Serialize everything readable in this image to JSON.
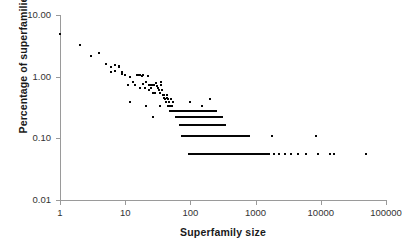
{
  "figure": {
    "background_color": "#ffffff",
    "axis_color": "#9a9a9a",
    "marker_color": "#050505",
    "label_color": "#333333",
    "title_color": "#1a1a1a"
  },
  "chart_data": {
    "type": "scatter",
    "title": "",
    "xlabel": "Superfamily size",
    "ylabel": "Percentage of superfamilies",
    "xscale": "log",
    "yscale": "log",
    "xlim": [
      1,
      100000
    ],
    "ylim": [
      0.01,
      10.0
    ],
    "grid": false,
    "legend": null,
    "xtick_labels": [
      "1",
      "10",
      "100",
      "1000",
      "10000",
      "100000"
    ],
    "xtick_values": [
      1,
      10,
      100,
      1000,
      10000,
      100000
    ],
    "ytick_labels": [
      "10.00",
      "1.00",
      "0.10",
      "0.01"
    ],
    "ytick_values": [
      10.0,
      1.0,
      0.1,
      0.01
    ],
    "marker": "small filled square",
    "marker_size_px": 2,
    "points": [
      [
        1,
        5.0
      ],
      [
        2,
        3.3
      ],
      [
        3,
        2.2
      ],
      [
        4,
        2.4
      ],
      [
        5,
        1.6
      ],
      [
        6,
        1.45
      ],
      [
        6,
        1.2
      ],
      [
        7,
        1.55
      ],
      [
        7,
        1.25
      ],
      [
        8,
        1.5
      ],
      [
        8,
        1.45
      ],
      [
        9,
        1.2
      ],
      [
        9,
        1.1
      ],
      [
        10,
        1.05
      ],
      [
        11,
        0.72
      ],
      [
        12,
        0.97
      ],
      [
        12,
        0.39
      ],
      [
        13,
        0.82
      ],
      [
        14,
        0.72
      ],
      [
        15,
        1.05
      ],
      [
        16,
        1.05
      ],
      [
        17,
        1.05
      ],
      [
        17,
        0.66
      ],
      [
        18,
        1.02
      ],
      [
        19,
        1.05
      ],
      [
        19,
        0.77
      ],
      [
        20,
        0.66
      ],
      [
        21,
        0.83
      ],
      [
        21,
        0.33
      ],
      [
        22,
        1.02
      ],
      [
        23,
        0.72
      ],
      [
        23,
        0.6
      ],
      [
        24,
        0.72
      ],
      [
        25,
        0.66
      ],
      [
        26,
        0.72
      ],
      [
        27,
        0.55
      ],
      [
        27,
        0.22
      ],
      [
        28,
        0.72
      ],
      [
        29,
        0.55
      ],
      [
        30,
        0.78
      ],
      [
        31,
        0.7
      ],
      [
        32,
        0.66
      ],
      [
        33,
        0.6
      ],
      [
        34,
        0.55
      ],
      [
        34,
        0.33
      ],
      [
        35,
        0.83
      ],
      [
        36,
        0.72
      ],
      [
        37,
        0.6
      ],
      [
        38,
        0.5
      ],
      [
        39,
        0.45
      ],
      [
        40,
        0.5
      ],
      [
        41,
        0.44
      ],
      [
        42,
        0.39
      ],
      [
        43,
        0.45
      ],
      [
        44,
        0.5
      ],
      [
        45,
        0.33
      ],
      [
        46,
        0.44
      ],
      [
        47,
        0.39
      ],
      [
        48,
        0.33
      ],
      [
        49,
        0.28
      ],
      [
        50,
        0.44
      ],
      [
        52,
        0.33
      ],
      [
        54,
        0.39
      ],
      [
        55,
        0.28
      ],
      [
        56,
        0.28
      ],
      [
        58,
        0.28
      ],
      [
        60,
        0.28
      ],
      [
        62,
        0.28
      ],
      [
        64,
        0.28
      ],
      [
        66,
        0.28
      ],
      [
        68,
        0.28
      ],
      [
        70,
        0.22
      ],
      [
        72,
        0.22
      ],
      [
        74,
        0.28
      ],
      [
        76,
        0.22
      ],
      [
        78,
        0.165
      ],
      [
        80,
        0.22
      ],
      [
        82,
        0.28
      ],
      [
        85,
        0.165
      ],
      [
        88,
        0.22
      ],
      [
        90,
        0.11
      ],
      [
        92,
        0.165
      ],
      [
        95,
        0.22
      ],
      [
        98,
        0.165
      ],
      [
        100,
        0.39
      ],
      [
        100,
        0.28
      ],
      [
        102,
        0.22
      ],
      [
        105,
        0.11
      ],
      [
        108,
        0.165
      ],
      [
        110,
        0.22
      ],
      [
        112,
        0.055
      ],
      [
        115,
        0.165
      ],
      [
        118,
        0.11
      ],
      [
        120,
        0.28
      ],
      [
        124,
        0.22
      ],
      [
        128,
        0.165
      ],
      [
        132,
        0.11
      ],
      [
        136,
        0.055
      ],
      [
        140,
        0.22
      ],
      [
        145,
        0.165
      ],
      [
        150,
        0.33
      ],
      [
        150,
        0.11
      ],
      [
        155,
        0.055
      ],
      [
        160,
        0.22
      ],
      [
        165,
        0.165
      ],
      [
        170,
        0.11
      ],
      [
        175,
        0.055
      ],
      [
        180,
        0.28
      ],
      [
        185,
        0.165
      ],
      [
        190,
        0.11
      ],
      [
        195,
        0.055
      ],
      [
        200,
        0.44
      ],
      [
        200,
        0.22
      ],
      [
        210,
        0.165
      ],
      [
        215,
        0.11
      ],
      [
        220,
        0.055
      ],
      [
        230,
        0.22
      ],
      [
        240,
        0.165
      ],
      [
        250,
        0.28
      ],
      [
        250,
        0.11
      ],
      [
        260,
        0.055
      ],
      [
        275,
        0.165
      ],
      [
        290,
        0.11
      ],
      [
        300,
        0.055
      ],
      [
        320,
        0.11
      ],
      [
        340,
        0.165
      ],
      [
        350,
        0.055
      ],
      [
        380,
        0.11
      ],
      [
        400,
        0.055
      ],
      [
        430,
        0.11
      ],
      [
        450,
        0.055
      ],
      [
        480,
        0.11
      ],
      [
        500,
        0.055
      ],
      [
        550,
        0.11
      ],
      [
        600,
        0.055
      ],
      [
        650,
        0.11
      ],
      [
        700,
        0.055
      ],
      [
        750,
        0.11
      ],
      [
        800,
        0.055
      ],
      [
        900,
        0.055
      ],
      [
        1000,
        0.055
      ],
      [
        1100,
        0.055
      ],
      [
        1300,
        0.055
      ],
      [
        1500,
        0.055
      ],
      [
        1800,
        0.11
      ],
      [
        1900,
        0.055
      ],
      [
        2300,
        0.055
      ],
      [
        2800,
        0.055
      ],
      [
        3500,
        0.055
      ],
      [
        4500,
        0.055
      ],
      [
        6000,
        0.055
      ],
      [
        8500,
        0.11
      ],
      [
        9000,
        0.055
      ],
      [
        14000,
        0.055
      ],
      [
        16000,
        0.055
      ],
      [
        50000,
        0.055
      ]
    ],
    "dense_bands": [
      {
        "value": 0.275,
        "x_from": 50,
        "x_to": 250,
        "count": 34
      },
      {
        "value": 0.22,
        "x_from": 60,
        "x_to": 300,
        "count": 46
      },
      {
        "value": 0.165,
        "x_from": 70,
        "x_to": 340,
        "count": 56
      },
      {
        "value": 0.11,
        "x_from": 75,
        "x_to": 800,
        "count": 86
      },
      {
        "value": 0.055,
        "x_from": 95,
        "x_to": 1600,
        "count": 170
      }
    ]
  }
}
